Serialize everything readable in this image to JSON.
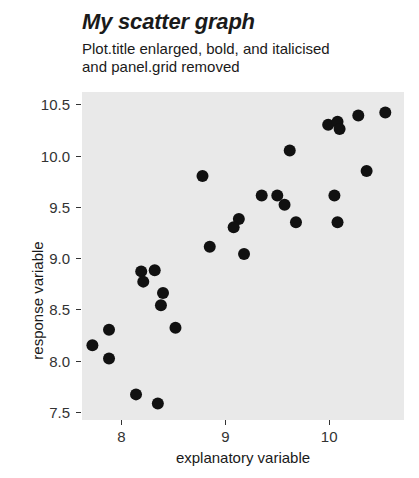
{
  "chart_data": {
    "type": "scatter",
    "title": "My scatter graph",
    "subtitle": "Plot.title enlarged, bold, and italicised\nand panel.grid removed",
    "xlabel": "explanatory variable",
    "ylabel": "response variable",
    "xlim": [
      7.62,
      10.72
    ],
    "ylim": [
      7.42,
      10.62
    ],
    "xticks": [
      "8",
      "9",
      "10"
    ],
    "xtick_values": [
      8,
      9,
      10
    ],
    "yticks": [
      "7.5",
      "8.0",
      "8.5",
      "9.0",
      "9.5",
      "10.0",
      "10.5"
    ],
    "ytick_values": [
      7.5,
      8.0,
      8.5,
      9.0,
      9.5,
      10.0,
      10.5
    ],
    "grid": false,
    "legend": null,
    "panel_background": "#e9e9e9",
    "point_color": "#111111",
    "point_size": 6,
    "points": [
      {
        "x": 7.72,
        "y": 8.15
      },
      {
        "x": 7.88,
        "y": 8.3
      },
      {
        "x": 7.88,
        "y": 8.02
      },
      {
        "x": 8.19,
        "y": 8.87
      },
      {
        "x": 8.32,
        "y": 8.88
      },
      {
        "x": 8.21,
        "y": 8.77
      },
      {
        "x": 8.4,
        "y": 8.66
      },
      {
        "x": 8.38,
        "y": 8.54
      },
      {
        "x": 8.14,
        "y": 7.67
      },
      {
        "x": 8.35,
        "y": 7.58
      },
      {
        "x": 8.52,
        "y": 8.32
      },
      {
        "x": 8.78,
        "y": 9.8
      },
      {
        "x": 8.85,
        "y": 9.11
      },
      {
        "x": 9.13,
        "y": 9.38
      },
      {
        "x": 9.08,
        "y": 9.3
      },
      {
        "x": 9.18,
        "y": 9.04
      },
      {
        "x": 9.35,
        "y": 9.61
      },
      {
        "x": 9.5,
        "y": 9.61
      },
      {
        "x": 9.57,
        "y": 9.52
      },
      {
        "x": 9.62,
        "y": 10.05
      },
      {
        "x": 9.68,
        "y": 9.35
      },
      {
        "x": 9.99,
        "y": 10.3
      },
      {
        "x": 10.08,
        "y": 10.33
      },
      {
        "x": 10.1,
        "y": 10.26
      },
      {
        "x": 10.05,
        "y": 9.61
      },
      {
        "x": 10.08,
        "y": 9.35
      },
      {
        "x": 10.28,
        "y": 10.39
      },
      {
        "x": 10.36,
        "y": 9.85
      },
      {
        "x": 10.54,
        "y": 10.42
      }
    ]
  }
}
